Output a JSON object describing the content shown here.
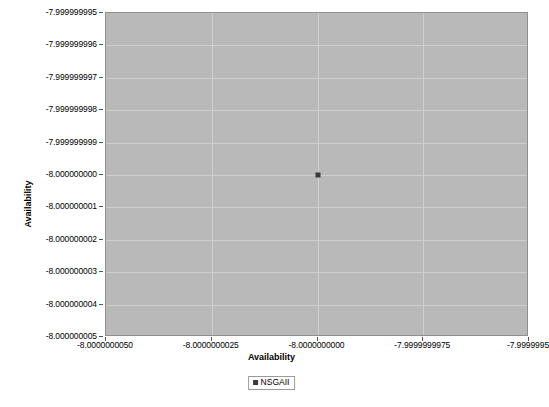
{
  "chart_data": {
    "type": "scatter",
    "title": "",
    "xlabel": "Availability",
    "ylabel": "Availability",
    "xlim": [
      -8.000000005,
      -7.999999995
    ],
    "ylim": [
      -8.000000005,
      -7.999999995
    ],
    "grid": true,
    "legend_position": "bottom-center",
    "x_tick_labels": [
      "-8.0000000050",
      "-8.0000000025",
      "-8.0000000000",
      "-7.9999999975",
      "-7.9999995"
    ],
    "x_tick_values": [
      -8.000000005,
      -8.0000000025,
      -8.0,
      -7.9999999975,
      -7.999999995
    ],
    "y_tick_labels": [
      "-7.999999995",
      "-7.999999996",
      "-7.999999997",
      "-7.999999998",
      "-7.999999999",
      "-8.000000000",
      "-8.000000001",
      "-8.000000002",
      "-8.000000003",
      "-8.000000004",
      "-8.000000005"
    ],
    "y_tick_values": [
      -7.999999995,
      -7.999999996,
      -7.999999997,
      -7.999999998,
      -7.999999999,
      -8.0,
      -8.000000001,
      -8.000000002,
      -8.000000003,
      -8.000000004,
      -8.000000005
    ],
    "series": [
      {
        "name": "NSGAII",
        "marker": "square",
        "color": "#3b3b3b",
        "points": [
          {
            "x": -8.0,
            "y": -8.0,
            "x_label": "-8.0000000000",
            "y_label": "-8.000000000"
          }
        ]
      }
    ]
  },
  "axes": {
    "y_title": "Availability",
    "x_title": "Availability"
  },
  "legend": {
    "entries": [
      {
        "label": "NSGAII",
        "color": "#3b3b3b"
      }
    ]
  },
  "colors": {
    "plot_background": "#b9b9b9",
    "gridline": "#cfcfcf",
    "marker": "#3b3b3b",
    "page_background": "#ffffff",
    "axis_border": "#8f8f8f"
  }
}
